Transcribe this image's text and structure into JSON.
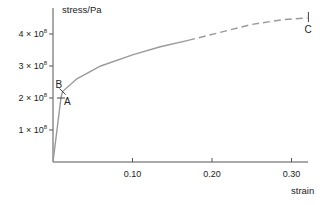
{
  "chart_data": {
    "type": "line",
    "title": "",
    "xlabel": "strain",
    "ylabel": "stress/Pa",
    "xlim": [
      0,
      0.33
    ],
    "ylim": [
      0,
      460000000.0
    ],
    "grid": false,
    "x_ticks": [
      {
        "value": 0.1,
        "label": "0.10"
      },
      {
        "value": 0.2,
        "label": "0.20"
      },
      {
        "value": 0.3,
        "label": "0.30"
      }
    ],
    "y_ticks": [
      {
        "value": 100000000.0,
        "label": "1 × 10",
        "exp": "8"
      },
      {
        "value": 200000000.0,
        "label": "2 × 10",
        "exp": "8"
      },
      {
        "value": 300000000.0,
        "label": "3 × 10",
        "exp": "8"
      },
      {
        "value": 400000000.0,
        "label": "4 × 10",
        "exp": "8"
      }
    ],
    "series": [
      {
        "name": "stress-strain curve (solid)",
        "style": "solid",
        "points": [
          [
            0,
            0
          ],
          [
            0.01,
            200000000.0
          ],
          [
            0.012,
            220000000.0
          ],
          [
            0.03,
            260000000.0
          ],
          [
            0.06,
            300000000.0
          ],
          [
            0.1,
            335000000.0
          ],
          [
            0.135,
            360000000.0
          ],
          [
            0.17,
            380000000.0
          ]
        ]
      },
      {
        "name": "stress-strain curve (dashed)",
        "style": "dashed",
        "points": [
          [
            0.17,
            380000000.0
          ],
          [
            0.21,
            405000000.0
          ],
          [
            0.25,
            430000000.0
          ],
          [
            0.29,
            445000000.0
          ],
          [
            0.32,
            450000000.0
          ]
        ]
      }
    ],
    "annotations": [
      {
        "label": "A",
        "x": 0.01,
        "y": 200000000.0
      },
      {
        "label": "B",
        "x": 0.012,
        "y": 220000000.0
      },
      {
        "label": "C",
        "x": 0.32,
        "y": 450000000.0
      }
    ]
  },
  "colors": {
    "axis": "#555555",
    "curve": "#9a9a9a",
    "text": "#222222"
  }
}
